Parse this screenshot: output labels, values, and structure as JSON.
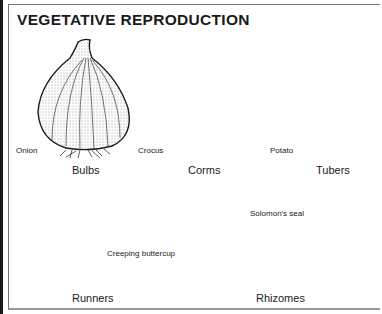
{
  "title": "VEGETATIVE REPRODUCTION",
  "panels": [
    {
      "category": "Bulbs",
      "example": "Onion"
    },
    {
      "category": "Corms",
      "example": "Crocus"
    },
    {
      "category": "Tubers",
      "example": "Potato"
    },
    {
      "category": "Runners",
      "example": "Creeping buttercup"
    },
    {
      "category": "Rhizomes",
      "example": "Solomon's seal"
    }
  ],
  "colors": {
    "ink": "#1a1a1a",
    "background": "#ffffff",
    "frame": "#777777"
  }
}
